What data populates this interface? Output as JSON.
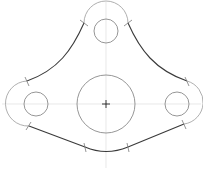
{
  "drawing": {
    "type": "2D mechanical part sketch (three-lobe plate)",
    "colors": {
      "background": "#ffffff",
      "outline": "#3a3a3a",
      "construction": "#9a9a9a",
      "hole": "#8a8a8a",
      "centerline": "#d9d9d9",
      "tick": "#7a7a7a",
      "center_mark": "#222222"
    },
    "center_mark": {
      "x": 106,
      "y": 104,
      "size": 4
    },
    "centerlines": {
      "horizontal": {
        "x1": 2,
        "y1": 104,
        "x2": 201,
        "y2": 104
      },
      "vertical": {
        "x1": 106,
        "y1": 2,
        "x2": 106,
        "y2": 168
      }
    },
    "main_circle": {
      "cx": 106,
      "cy": 104,
      "r": 29
    },
    "lobes": [
      {
        "name": "top",
        "hole": {
          "cx": 106,
          "cy": 31,
          "r": 12
        },
        "arc_r": 22
      },
      {
        "name": "left",
        "hole": {
          "cx": 36,
          "cy": 104,
          "r": 12
        },
        "arc_r": 22
      },
      {
        "name": "right",
        "hole": {
          "cx": 177,
          "cy": 104,
          "r": 12
        },
        "arc_r": 22
      }
    ],
    "outline_path": "M 84 23 C 72 50, 58 70, 27 81 M 128 23 C 140 50, 155 70, 187 81 M 29 126 L 85 147 Q 106 156 128 147 L 184 124",
    "arcs": [
      {
        "name": "top-arc",
        "d": "M 84 23 A 22 22 0 0 1 128 23"
      },
      {
        "name": "left-arc",
        "d": "M 27 81 A 22 22 0 0 0 29 126"
      },
      {
        "name": "right-arc",
        "d": "M 187 81 A 22 22 0 0 1 184 124"
      }
    ],
    "tangent_ticks": [
      {
        "x1": 80,
        "y1": 20,
        "x2": 88,
        "y2": 26
      },
      {
        "x1": 124,
        "y1": 26,
        "x2": 132,
        "y2": 20
      },
      {
        "x1": 25,
        "y1": 77,
        "x2": 29,
        "y2": 86
      },
      {
        "x1": 26,
        "y1": 130,
        "x2": 31,
        "y2": 122
      },
      {
        "x1": 185,
        "y1": 77,
        "x2": 189,
        "y2": 86
      },
      {
        "x1": 182,
        "y1": 120,
        "x2": 186,
        "y2": 129
      },
      {
        "x1": 84,
        "y1": 143,
        "x2": 86,
        "y2": 152
      },
      {
        "x1": 127,
        "y1": 143,
        "x2": 129,
        "y2": 152
      }
    ]
  }
}
